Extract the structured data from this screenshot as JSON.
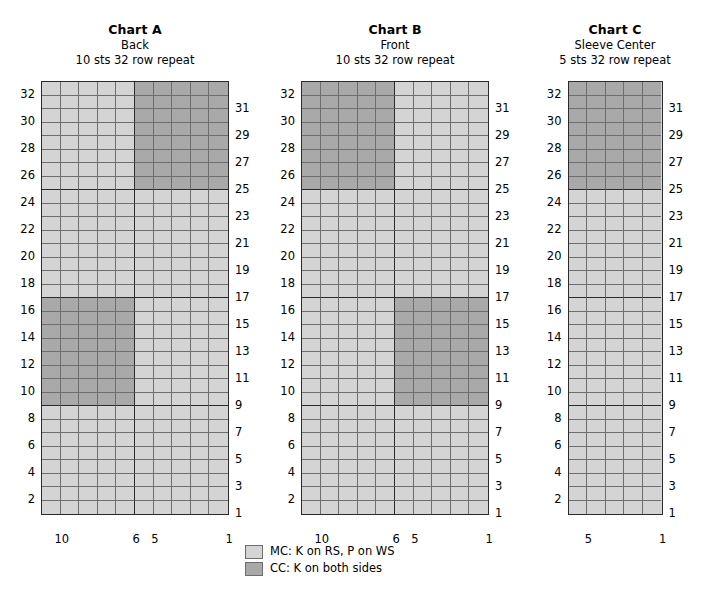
{
  "colors": {
    "mc_fill": "#d4d4d4",
    "cc_fill": "#a9a9a9",
    "grid_line": "#6e6e6e",
    "heavy_line": "#2b2b2b",
    "background": "#ffffff",
    "text": "#000000"
  },
  "charts": [
    {
      "id": "chart-a",
      "title": "Chart A",
      "subtitle": "Back",
      "repeat": "10 sts 32 row repeat",
      "stitches": 10,
      "rows": 32,
      "cell_w": 18.6,
      "cell_h": 13.5,
      "col_labels": [
        {
          "text": "10",
          "stitch": 10
        },
        {
          "text": "6",
          "stitch": 6
        },
        {
          "text": "5",
          "stitch": 5
        },
        {
          "text": "1",
          "stitch": 1
        }
      ],
      "left_row_labels": [
        32,
        30,
        28,
        26,
        24,
        22,
        20,
        18,
        16,
        14,
        12,
        10,
        8,
        6,
        4,
        2
      ],
      "right_row_labels": [
        31,
        29,
        27,
        25,
        23,
        21,
        19,
        17,
        15,
        13,
        11,
        9,
        7,
        5,
        3,
        1
      ],
      "cc_blocks": [
        {
          "row_from": 25,
          "row_to": 32,
          "st_from": 1,
          "st_to": 5
        },
        {
          "row_from": 9,
          "row_to": 16,
          "st_from": 6,
          "st_to": 10
        }
      ]
    },
    {
      "id": "chart-b",
      "title": "Chart B",
      "subtitle": "Front",
      "repeat": "10 sts 32 row repeat",
      "stitches": 10,
      "rows": 32,
      "cell_w": 18.6,
      "cell_h": 13.5,
      "col_labels": [
        {
          "text": "10",
          "stitch": 10
        },
        {
          "text": "6",
          "stitch": 6
        },
        {
          "text": "5",
          "stitch": 5
        },
        {
          "text": "1",
          "stitch": 1
        }
      ],
      "left_row_labels": [
        32,
        30,
        28,
        26,
        24,
        22,
        20,
        18,
        16,
        14,
        12,
        10,
        8,
        6,
        4,
        2
      ],
      "right_row_labels": [
        31,
        29,
        27,
        25,
        23,
        21,
        19,
        17,
        15,
        13,
        11,
        9,
        7,
        5,
        3,
        1
      ],
      "cc_blocks": [
        {
          "row_from": 25,
          "row_to": 32,
          "st_from": 6,
          "st_to": 10
        },
        {
          "row_from": 9,
          "row_to": 16,
          "st_from": 1,
          "st_to": 5
        }
      ]
    },
    {
      "id": "chart-c",
      "title": "Chart C",
      "subtitle": "Sleeve Center",
      "repeat": "5 sts 32 row repeat",
      "stitches": 5,
      "rows": 32,
      "cell_w": 18.6,
      "cell_h": 13.5,
      "col_labels": [
        {
          "text": "5",
          "stitch": 5
        },
        {
          "text": "1",
          "stitch": 1
        }
      ],
      "left_row_labels": [
        32,
        30,
        28,
        26,
        24,
        22,
        20,
        18,
        16,
        14,
        12,
        10,
        8,
        6,
        4,
        2
      ],
      "right_row_labels": [
        31,
        29,
        27,
        25,
        23,
        21,
        19,
        17,
        15,
        13,
        11,
        9,
        7,
        5,
        3,
        1
      ],
      "cc_blocks": [
        {
          "row_from": 25,
          "row_to": 32,
          "st_from": 1,
          "st_to": 5
        }
      ]
    }
  ],
  "heavy_row_boundaries": [
    8,
    16,
    24
  ],
  "heavy_col_boundary": 6,
  "legend": [
    {
      "swatch": "mc",
      "label": "MC: K on RS, P on WS"
    },
    {
      "swatch": "cc",
      "label": "CC: K on both sides"
    }
  ]
}
